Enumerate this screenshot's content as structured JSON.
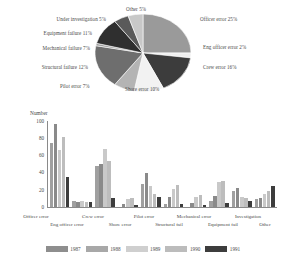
{
  "chart_data": [
    {
      "type": "pie",
      "title": "",
      "categories": [
        "Officer error",
        "Eng officer error",
        "Crew error",
        "Shore error",
        "Pilot error",
        "Structural failure",
        "Mechanical failure",
        "Equipment failure",
        "Under investigation",
        "Other"
      ],
      "values": [
        25,
        2,
        16,
        10,
        7,
        12,
        7,
        11,
        5,
        5
      ],
      "unit": "%",
      "labels": [
        {
          "text": "Officer error 25%",
          "side": "right"
        },
        {
          "text": "Eng officer error 2%",
          "side": "right"
        },
        {
          "text": "Crew error 16%",
          "side": "right"
        },
        {
          "text": "Shore error 10%",
          "side": "bottom"
        },
        {
          "text": "Pilot error 7%",
          "side": "bottom"
        },
        {
          "text": "Structural failure 12%",
          "side": "left"
        },
        {
          "text": "Mechanical failure 7%",
          "side": "left"
        },
        {
          "text": "Equipment failure 11%",
          "side": "left"
        },
        {
          "text": "Under investigation 5%",
          "side": "left"
        },
        {
          "text": "Other 5%",
          "side": "top"
        }
      ],
      "slice_colors": [
        "#9a9a9a",
        "#efefef",
        "#3c3c3c",
        "#f2f2f2",
        "#b4b4b4",
        "#6e6e6e",
        "#9e9e9e",
        "#2f2f2f",
        "#5a5a5a",
        "#c8c8c8"
      ],
      "legend": "none"
    },
    {
      "type": "bar",
      "title": "",
      "ylabel": "Number",
      "xlabel": "",
      "ylim": [
        0,
        100
      ],
      "yticks": [
        "0",
        "20",
        "40",
        "60",
        "80",
        "100"
      ],
      "grid": false,
      "legend_position": "bottom",
      "categories": [
        "Officer error",
        "Eng officer error",
        "Crew error",
        "Shore error",
        "Pilot error",
        "Structural fail",
        "Mechanical error",
        "Equipment fail",
        "Investigation",
        "Other"
      ],
      "series": [
        {
          "name": "1987",
          "color": "#a0a0a0",
          "values": [
            75,
            7,
            48,
            0,
            27,
            4,
            0,
            7,
            19,
            9
          ]
        },
        {
          "name": "1988",
          "color": "#8a8a8a",
          "values": [
            96,
            6,
            50,
            3,
            40,
            12,
            5,
            13,
            22,
            11
          ]
        },
        {
          "name": "1989",
          "color": "#c9c9c9",
          "values": [
            66,
            7,
            67,
            9,
            24,
            21,
            12,
            29,
            12,
            15
          ]
        },
        {
          "name": "1990",
          "color": "#bdbdbd",
          "values": [
            81,
            6,
            53,
            10,
            15,
            26,
            14,
            30,
            10,
            19
          ]
        },
        {
          "name": "1991",
          "color": "#3d3d3d",
          "values": [
            35,
            6,
            11,
            2,
            12,
            3,
            2,
            5,
            7,
            24
          ]
        }
      ]
    }
  ],
  "pie": {
    "labels": {
      "other": "Other 5%",
      "under_investigation": "Under investigation 5%",
      "equipment_failure": "Equipment failure 11%",
      "mechanical_failure": "Mechanical failure 7%",
      "structural_failure": "Structural failure 12%",
      "pilot_error": "Pilot error 7%",
      "shore_error": "Shore error 10%",
      "crew_error": "Crew error 16%",
      "eng_officer_error": "Eng officer error 2%",
      "officer_error": "Officer error 25%"
    }
  },
  "bar": {
    "y_axis_title": "Number",
    "yticks": {
      "t100": "100",
      "t80": "80",
      "t60": "60",
      "t40": "40",
      "t20": "20",
      "t0": "0"
    },
    "xlabels_top": {
      "officer_error": "Officer error",
      "crew_error": "Crew error",
      "pilot_error": "Pilot error",
      "mechanical_error": "Mechanical error",
      "investigation": "Investigation"
    },
    "xlabels_bottom": {
      "eng_officer_error": "Eng officer error",
      "shore_error": "Shore error",
      "structural_fail": "Structural fail",
      "equipment_fail": "Equipment fail",
      "other": "Other"
    }
  },
  "legend": {
    "items": [
      {
        "label": "1987",
        "color": "#8e8e8e"
      },
      {
        "label": "1988",
        "color": "#a8a8a8"
      },
      {
        "label": "1989",
        "color": "#cfcfcf"
      },
      {
        "label": "1990",
        "color": "#bcbcbc"
      },
      {
        "label": "1991",
        "color": "#3d3d3d"
      }
    ]
  }
}
